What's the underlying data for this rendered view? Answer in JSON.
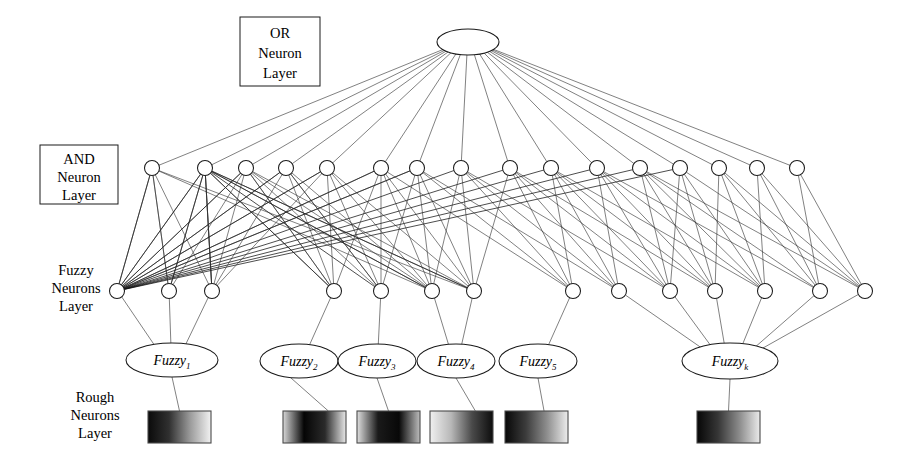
{
  "figure": {
    "background_color": "#ffffff",
    "line_color": "#2b2b2b",
    "node_fill": "#ffffff",
    "node_stroke": "#1a1a1a"
  },
  "layer_labels": {
    "or": {
      "line1": "OR",
      "line2": "Neuron",
      "line3": "Layer",
      "boxed": true
    },
    "and": {
      "line1": "AND",
      "line2": "Neuron",
      "line3": "Layer",
      "boxed": true
    },
    "fuzzy": {
      "line1": "Fuzzy",
      "line2": "Neurons",
      "line3": "Layer",
      "boxed": false
    },
    "rough": {
      "line1": "Rough",
      "line2": "Neurons",
      "line3": "Layer",
      "boxed": false
    }
  },
  "or_layer": {
    "count": 1,
    "nodes": [
      {
        "cx": 468,
        "cy": 42,
        "rx": 31,
        "ry": 13
      }
    ]
  },
  "and_layer": {
    "count": 16,
    "cy": 168,
    "r": 7.5,
    "x_positions": [
      152,
      205,
      246,
      286,
      327,
      381,
      417,
      461,
      510,
      551,
      597,
      640,
      680,
      719,
      757,
      797
    ]
  },
  "fuzzy_layer": {
    "count": 14,
    "cy": 291,
    "r": 7.5,
    "x_positions": [
      117,
      169,
      212,
      334,
      381,
      432,
      474,
      573,
      619,
      670,
      715,
      765,
      820,
      865
    ]
  },
  "fuzzy_groups": [
    {
      "label": "Fuzzy",
      "subscript": "1",
      "cx": 172,
      "cy": 360,
      "rx": 46,
      "ry": 17,
      "inputs": [
        117,
        169,
        212
      ]
    },
    {
      "label": "Fuzzy",
      "subscript": "2",
      "cx": 299,
      "cy": 361,
      "rx": 39,
      "ry": 17,
      "inputs": [
        334
      ]
    },
    {
      "label": "Fuzzy",
      "subscript": "3",
      "cx": 377,
      "cy": 361,
      "rx": 39,
      "ry": 17,
      "inputs": [
        381
      ]
    },
    {
      "label": "Fuzzy",
      "subscript": "4",
      "cx": 456,
      "cy": 361,
      "rx": 39,
      "ry": 17,
      "inputs": [
        432,
        474
      ]
    },
    {
      "label": "Fuzzy",
      "subscript": "5",
      "cx": 538,
      "cy": 361,
      "rx": 39,
      "ry": 17,
      "inputs": [
        573
      ]
    },
    {
      "label": "Fuzzy",
      "subscript": "k",
      "cx": 730,
      "cy": 361,
      "rx": 48,
      "ry": 18,
      "inputs": [
        619,
        670,
        715,
        765,
        820,
        865
      ]
    }
  ],
  "rough_layer": {
    "count": 6,
    "y": 411,
    "width": 63,
    "height": 32,
    "nodes": [
      {
        "x": 148,
        "gradient": "dark-to-light",
        "stops": [
          "#0a0a0a",
          "#303030",
          "#9a9a9a",
          "#f2f2f2"
        ]
      },
      {
        "x": 283,
        "gradient": "light-dark-light",
        "stops": [
          "#d8d8d8",
          "#050505",
          "#2a2a2a",
          "#e8e8e8"
        ]
      },
      {
        "x": 357,
        "gradient": "light-to-dark-center",
        "stops": [
          "#e0e0e0",
          "#1a1a1a",
          "#080808",
          "#bdbdbd"
        ]
      },
      {
        "x": 430,
        "gradient": "light-to-dark",
        "stops": [
          "#f0f0f0",
          "#b8b8b8",
          "#4a4a4a",
          "#0d0d0d"
        ]
      },
      {
        "x": 505,
        "gradient": "dark-to-light",
        "stops": [
          "#070707",
          "#3c3c3c",
          "#8e8e8e",
          "#ededed"
        ]
      },
      {
        "x": 697,
        "gradient": "dark-to-light",
        "stops": [
          "#060606",
          "#363636",
          "#8a8a8a",
          "#ebebeb"
        ]
      }
    ]
  },
  "connections": {
    "or_to_and_description": "single OR neuron fans out to all 16 AND neurons",
    "and_to_fuzzy_description": "AND neurons connect densely to fuzzy neurons; leftmost fuzzy neuron fans to many AND neurons",
    "fuzzy_to_group_description": "fuzzy neurons feed their fuzzy group ellipse",
    "group_to_rough_description": "each fuzzy group ellipse links down to its rough neuron block"
  }
}
